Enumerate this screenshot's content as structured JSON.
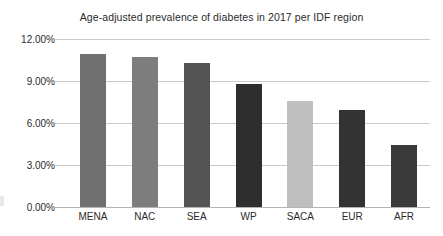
{
  "chart_data": {
    "type": "bar",
    "title": "Age-adjusted prevalence of diabetes in 2017 per IDF region",
    "xlabel": "",
    "ylabel": "",
    "categories": [
      "MENA",
      "NAC",
      "SEA",
      "WP",
      "SACA",
      "EUR",
      "AFR"
    ],
    "values": [
      10.9,
      10.7,
      10.3,
      8.8,
      7.6,
      6.9,
      4.4
    ],
    "value_labels": [
      "10.90%",
      "10.70%",
      "10.30%",
      "8.80%",
      "7.60%",
      "6.90%",
      "4.40%"
    ],
    "ylim": [
      0,
      12
    ],
    "ytick_values": [
      0,
      3,
      6,
      9,
      12
    ],
    "ytick_labels": [
      "0.00%",
      "3.00%",
      "6.00%",
      "9.00%",
      "12.00%"
    ],
    "grid": true,
    "legend": false,
    "bar_colors": [
      "#707070",
      "#7d7d7d",
      "#545454",
      "#2e2e2e",
      "#bfbfbf",
      "#333333",
      "#3a3a3a"
    ],
    "gridline_color": "#c9c9c9",
    "axis_color": "#b4b4b4",
    "text_color": "#2b2b2b",
    "background_color": "#ffffff"
  }
}
